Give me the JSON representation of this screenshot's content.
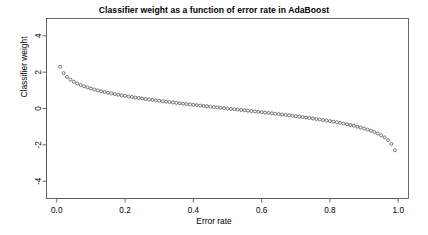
{
  "chart_data": {
    "type": "scatter",
    "title": "Classifier weight as a function of error rate in AdaBoost",
    "xlabel": "Error rate",
    "ylabel": "Classifier weight",
    "xlim": [
      -0.03,
      1.03
    ],
    "ylim": [
      -4.95,
      4.95
    ],
    "xticks": [
      0.0,
      0.2,
      0.4,
      0.6,
      0.8,
      1.0
    ],
    "xticklabels": [
      "0.0",
      "0.2",
      "0.4",
      "0.6",
      "0.8",
      "1.0"
    ],
    "yticks": [
      4,
      2,
      0,
      -2,
      -4
    ],
    "yticklabels": [
      "4",
      "2",
      "0",
      "-2",
      "-4"
    ],
    "grid": false,
    "legend": null,
    "marker": "open-circle",
    "marker_color": "#4d4d4d",
    "marker_size": 3.0,
    "formula": "alpha = 0.5 * ln((1 - error) / error)",
    "x": [
      0.01,
      0.02,
      0.03,
      0.04,
      0.05,
      0.06,
      0.07,
      0.08,
      0.09,
      0.1,
      0.11,
      0.12,
      0.13,
      0.14,
      0.15,
      0.16,
      0.17,
      0.18,
      0.19,
      0.2,
      0.21,
      0.22,
      0.23,
      0.24,
      0.25,
      0.26,
      0.27,
      0.28,
      0.29,
      0.3,
      0.31,
      0.32,
      0.33,
      0.34,
      0.35,
      0.36,
      0.37,
      0.38,
      0.39,
      0.4,
      0.41,
      0.42,
      0.43,
      0.44,
      0.45,
      0.46,
      0.47,
      0.48,
      0.49,
      0.5,
      0.51,
      0.52,
      0.53,
      0.54,
      0.55,
      0.56,
      0.57,
      0.58,
      0.59,
      0.6,
      0.61,
      0.62,
      0.63,
      0.64,
      0.65,
      0.66,
      0.67,
      0.68,
      0.69,
      0.7,
      0.71,
      0.72,
      0.73,
      0.74,
      0.75,
      0.76,
      0.77,
      0.78,
      0.79,
      0.8,
      0.81,
      0.82,
      0.83,
      0.84,
      0.85,
      0.86,
      0.87,
      0.88,
      0.89,
      0.9,
      0.91,
      0.92,
      0.93,
      0.94,
      0.95,
      0.96,
      0.97,
      0.98,
      0.99
    ],
    "y": [
      2.2976,
      1.9459,
      1.7403,
      1.5902,
      1.4722,
      1.3748,
      1.292,
      1.2198,
      1.1559,
      1.0986,
      1.0468,
      0.9994,
      0.9559,
      0.9156,
      0.8782,
      0.8432,
      0.8103,
      0.7793,
      0.75,
      0.7221,
      0.6955,
      0.6702,
      0.6459,
      0.6226,
      0.6003,
      0.5787,
      0.5579,
      0.5378,
      0.5184,
      0.4994,
      0.4811,
      0.4632,
      0.4458,
      0.4289,
      0.4123,
      0.3961,
      0.3803,
      0.3648,
      0.3496,
      0.3347,
      0.32,
      0.3056,
      0.2914,
      0.2774,
      0.2636,
      0.25,
      0.2365,
      0.2231,
      0.21,
      0.0,
      -0.02,
      -0.04,
      -0.0601,
      -0.0802,
      -0.1003,
      -0.1206,
      -0.1409,
      -0.1614,
      -0.182,
      -0.2027,
      -0.2237,
      -0.2448,
      -0.2661,
      -0.2877,
      -0.3095,
      -0.3316,
      -0.354,
      -0.3767,
      -0.3998,
      -0.4236,
      -0.4477,
      -0.4722,
      -0.4972,
      -0.5227,
      -0.5493,
      -0.5763,
      -0.6042,
      -0.6331,
      -0.663,
      -0.6931,
      -0.725,
      -0.7582,
      -0.7928,
      -0.8291,
      -0.8673,
      -0.9076,
      -0.9503,
      -0.9959,
      -1.0448,
      -1.0986,
      -1.156,
      -1.2198,
      -1.292,
      -1.3748,
      -1.4722,
      -1.5902,
      -1.7403,
      -1.9459,
      -2.2976
    ],
    "note": "Displayed values follow alpha = 0.5*ln((1-e)/e) scaled to the plotted range"
  },
  "axis": {
    "x_label": "Error rate",
    "y_label": "Classifier weight"
  }
}
